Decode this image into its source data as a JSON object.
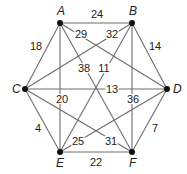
{
  "diagram": {
    "type": "weighted-undirected-graph",
    "nodes": [
      {
        "id": "A",
        "label": "A",
        "x": 60,
        "y": 23,
        "lx": 57,
        "ly": 15
      },
      {
        "id": "B",
        "label": "B",
        "x": 132,
        "y": 23,
        "lx": 129,
        "ly": 15
      },
      {
        "id": "C",
        "label": "C",
        "x": 25,
        "y": 89,
        "lx": 12,
        "ly": 93
      },
      {
        "id": "D",
        "label": "D",
        "x": 167,
        "y": 89,
        "lx": 173,
        "ly": 93
      },
      {
        "id": "E",
        "label": "E",
        "x": 60,
        "y": 152,
        "lx": 56,
        "ly": 167
      },
      {
        "id": "F",
        "label": "F",
        "x": 132,
        "y": 152,
        "lx": 129,
        "ly": 167
      }
    ],
    "edges": [
      {
        "from": "A",
        "to": "B",
        "weight": "24",
        "wx": 97,
        "wy": 18
      },
      {
        "from": "A",
        "to": "C",
        "weight": "18",
        "wx": 36,
        "wy": 50
      },
      {
        "from": "A",
        "to": "D",
        "weight": "29",
        "wx": 81,
        "wy": 38
      },
      {
        "from": "A",
        "to": "E",
        "weight": "20",
        "wx": 62,
        "wy": 103
      },
      {
        "from": "A",
        "to": "F",
        "weight": "38",
        "wx": 84,
        "wy": 72
      },
      {
        "from": "B",
        "to": "C",
        "weight": "32",
        "wx": 112,
        "wy": 38
      },
      {
        "from": "B",
        "to": "D",
        "weight": "14",
        "wx": 155,
        "wy": 50
      },
      {
        "from": "B",
        "to": "E",
        "weight": "11",
        "wx": 104,
        "wy": 72
      },
      {
        "from": "B",
        "to": "F",
        "weight": "36",
        "wx": 133,
        "wy": 103
      },
      {
        "from": "C",
        "to": "D",
        "weight": "13",
        "wx": 112,
        "wy": 93
      },
      {
        "from": "C",
        "to": "E",
        "weight": "4",
        "wx": 38,
        "wy": 132
      },
      {
        "from": "C",
        "to": "F",
        "weight": "31",
        "wx": 111,
        "wy": 145
      },
      {
        "from": "D",
        "to": "E",
        "weight": "25",
        "wx": 78,
        "wy": 145
      },
      {
        "from": "D",
        "to": "F",
        "weight": "7",
        "wx": 155,
        "wy": 132
      },
      {
        "from": "E",
        "to": "F",
        "weight": "22",
        "wx": 96,
        "wy": 166
      }
    ]
  }
}
